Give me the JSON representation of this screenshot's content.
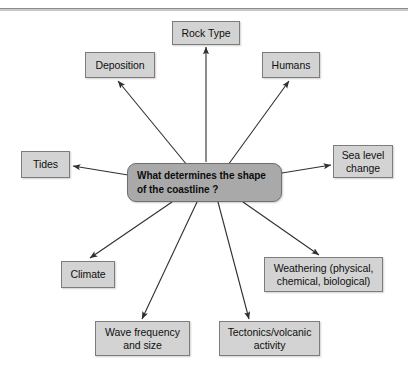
{
  "diagram": {
    "kind": "mind-map",
    "top_rule": "horizontal-divider",
    "center": {
      "label": "What determines the shape\nof the coastline ?",
      "fill": "#a9a9a9",
      "border": "#6e6e6e"
    },
    "node_fill": "#d3d3d3",
    "node_border": "#7c7c7c",
    "arrow_color": "#333333",
    "nodes": [
      {
        "id": "rock-type",
        "label": "Rock Type"
      },
      {
        "id": "deposition",
        "label": "Deposition"
      },
      {
        "id": "humans",
        "label": "Humans"
      },
      {
        "id": "tides",
        "label": "Tides"
      },
      {
        "id": "sea-level-change",
        "label": "Sea level\nchange"
      },
      {
        "id": "climate",
        "label": "Climate"
      },
      {
        "id": "weathering",
        "label": "Weathering (physical,\nchemical, biological)"
      },
      {
        "id": "wave-frequency",
        "label": "Wave frequency\nand size"
      },
      {
        "id": "tectonics",
        "label": "Tectonics/volcanic\nactivity"
      }
    ]
  }
}
